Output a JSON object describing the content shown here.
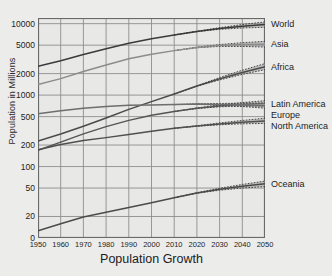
{
  "chart_data": {
    "type": "line",
    "title": "Population Growth",
    "xlabel": "Population Growth",
    "ylabel": "Population in Millions",
    "yscale": "log",
    "grid": true,
    "legend_position": "right-inline",
    "xlim": [
      1950,
      2050
    ],
    "ylim": [
      10,
      12000
    ],
    "x": [
      1950,
      1960,
      1970,
      1980,
      1990,
      2000,
      2010,
      2020,
      2030,
      2040,
      2050
    ],
    "xticks": [
      "1950",
      "1960",
      "1970",
      "1980",
      "1990",
      "2000",
      "2010",
      "2020",
      "2030",
      "2040",
      "2050"
    ],
    "yticks": [
      "10000",
      "5000",
      "2000",
      "1000",
      "500",
      "200",
      "100",
      "50",
      "20",
      "0"
    ],
    "ytick_values": [
      10000,
      5000,
      2000,
      1000,
      500,
      200,
      100,
      50,
      20,
      0
    ],
    "projection_start": 2010,
    "series": [
      {
        "name": "World",
        "color": "#3a3a3a",
        "values": [
          2536,
          3034,
          3700,
          4458,
          5327,
          6143,
          6957,
          7795,
          8548,
          9199,
          9735
        ],
        "band_low": [
          2536,
          3034,
          3700,
          4458,
          5327,
          6143,
          6957,
          7740,
          8320,
          8700,
          8900
        ],
        "band_high": [
          2536,
          3034,
          3700,
          4458,
          5327,
          6143,
          6957,
          7850,
          8790,
          9720,
          10600
        ]
      },
      {
        "name": "Asia",
        "color": "#8c8c8c",
        "values": [
          1404,
          1700,
          2138,
          2642,
          3221,
          3741,
          4194,
          4641,
          4947,
          5099,
          5157
        ],
        "band_low": [
          1404,
          1700,
          2138,
          2642,
          3221,
          3741,
          4194,
          4600,
          4800,
          4800,
          4700
        ],
        "band_high": [
          1404,
          1700,
          2138,
          2642,
          3221,
          3741,
          4194,
          4690,
          5100,
          5420,
          5650
        ]
      },
      {
        "name": "Africa",
        "color": "#4a4a4a",
        "values": [
          228,
          285,
          366,
          478,
          631,
          811,
          1039,
          1341,
          1688,
          2077,
          2489
        ],
        "band_low": [
          228,
          285,
          366,
          478,
          631,
          811,
          1039,
          1330,
          1630,
          1950,
          2270
        ],
        "band_high": [
          228,
          285,
          366,
          478,
          631,
          811,
          1039,
          1355,
          1760,
          2230,
          2760
        ]
      },
      {
        "name": "Latin America",
        "color": "#555555",
        "values": [
          169,
          220,
          287,
          362,
          443,
          521,
          591,
          654,
          706,
          740,
          762
        ],
        "band_low": [
          169,
          220,
          287,
          362,
          443,
          521,
          591,
          648,
          686,
          700,
          696
        ],
        "band_high": [
          169,
          220,
          287,
          362,
          443,
          521,
          591,
          662,
          730,
          786,
          836
        ]
      },
      {
        "name": "Europe",
        "color": "#6e6e6e",
        "values": [
          549,
          605,
          657,
          694,
          721,
          726,
          736,
          748,
          741,
          728,
          710
        ],
        "band_low": [
          549,
          605,
          657,
          694,
          721,
          726,
          736,
          742,
          722,
          692,
          655
        ],
        "band_high": [
          549,
          605,
          657,
          694,
          721,
          726,
          736,
          754,
          764,
          770,
          775
        ]
      },
      {
        "name": "North America",
        "color": "#4f4f4f",
        "values": [
          172,
          204,
          231,
          254,
          280,
          313,
          343,
          369,
          395,
          417,
          435
        ],
        "band_low": [
          172,
          204,
          231,
          254,
          280,
          313,
          343,
          366,
          384,
          396,
          402
        ],
        "band_high": [
          172,
          204,
          231,
          254,
          280,
          313,
          343,
          373,
          408,
          442,
          474
        ]
      },
      {
        "name": "Oceania",
        "color": "#4a4a4a",
        "values": [
          12.6,
          15.8,
          19.7,
          22.9,
          26.8,
          31.1,
          36.6,
          42.7,
          48.1,
          53.0,
          57.4
        ],
        "band_low": [
          12.6,
          15.8,
          19.7,
          22.9,
          26.8,
          31.1,
          36.6,
          42.3,
          46.6,
          50.0,
          52.5
        ],
        "band_high": [
          12.6,
          15.8,
          19.7,
          22.9,
          26.8,
          31.1,
          36.6,
          43.1,
          49.7,
          56.2,
          62.6
        ]
      }
    ]
  }
}
